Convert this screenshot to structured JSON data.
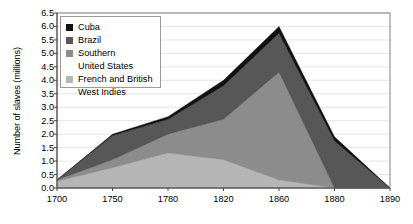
{
  "chart_data": {
    "type": "area",
    "title": "",
    "xlabel": "",
    "ylabel": "Number of slaves (millions)",
    "ylim": [
      0.0,
      6.5
    ],
    "grid": true,
    "legend_position": "top-left",
    "stacked": true,
    "x": [
      1700,
      1750,
      1780,
      1820,
      1860,
      1880,
      1890
    ],
    "xtick_labels": [
      "1700",
      "1750",
      "1780",
      "1820",
      "1860",
      "1880",
      "1890"
    ],
    "ytick_labels": [
      "0.0",
      "0.5",
      "1.0",
      "1.5",
      "2.0",
      "2.5",
      "3.0",
      "3.5",
      "4.0",
      "4.5",
      "5.0",
      "5.5",
      "6.0",
      "6.5"
    ],
    "ytick_values": [
      0.0,
      0.5,
      1.0,
      1.5,
      2.0,
      2.5,
      3.0,
      3.5,
      4.0,
      4.5,
      5.0,
      5.5,
      6.0,
      6.5
    ],
    "series": [
      {
        "name": "French and British West Indies",
        "color": "#b5b5b5",
        "values": [
          0.25,
          0.75,
          1.3,
          1.05,
          0.3,
          0.0,
          0.0
        ]
      },
      {
        "name": "Southern United States",
        "color": "#8c8c8c",
        "values": [
          0.05,
          0.3,
          0.7,
          1.5,
          4.0,
          0.0,
          0.0
        ]
      },
      {
        "name": "Brazil",
        "color": "#575757",
        "values": [
          0.0,
          0.9,
          0.55,
          1.25,
          1.45,
          1.75,
          0.0
        ]
      },
      {
        "name": "Cuba",
        "color": "#111111",
        "values": [
          0.0,
          0.05,
          0.1,
          0.2,
          0.25,
          0.15,
          0.0
        ]
      }
    ],
    "totals": [
      0.3,
      2.0,
      2.65,
      4.0,
      6.0,
      1.9,
      0.0
    ]
  },
  "legend": {
    "entries": [
      {
        "label": "Cuba",
        "label2": ""
      },
      {
        "label": "Brazil",
        "label2": ""
      },
      {
        "label": "Southern",
        "label2": "United States"
      },
      {
        "label": "French and British",
        "label2": "West Indies"
      }
    ]
  }
}
